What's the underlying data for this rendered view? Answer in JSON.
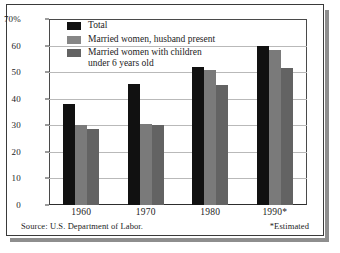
{
  "chart_data": {
    "type": "bar",
    "title": "",
    "xlabel": "",
    "ylabel": "",
    "categories": [
      "1960",
      "1970",
      "1980",
      "1990*"
    ],
    "series": [
      {
        "name": "Total",
        "color": "#111111",
        "values": [
          38,
          45.5,
          52,
          60
        ]
      },
      {
        "name": "Married women, husband present",
        "color": "#7a7a7a",
        "values": [
          30,
          30.5,
          51,
          58.5
        ]
      },
      {
        "name": "Married women with children\nunder 6 years old",
        "color": "#636363",
        "values": [
          28.5,
          30,
          45,
          51.5
        ]
      }
    ],
    "ylim": [
      0,
      70
    ],
    "yticks": [
      "0",
      "10",
      "20",
      "30",
      "40",
      "50",
      "60",
      "70%"
    ],
    "ytick_values": [
      0,
      10,
      20,
      30,
      40,
      50,
      60,
      70
    ],
    "grid": true,
    "legend_position": "top-left"
  },
  "legend": {
    "items": [
      {
        "label": "Total",
        "swatch": "legend-swatch-total"
      },
      {
        "label": "Married women, husband present",
        "swatch": "legend-swatch-husband-present"
      },
      {
        "label": "Married women with children\nunder 6 years old",
        "swatch": "legend-swatch-children-under-6"
      }
    ]
  },
  "footer": {
    "source": "Source: U.S. Department of Labor.",
    "note": "*Estimated"
  }
}
